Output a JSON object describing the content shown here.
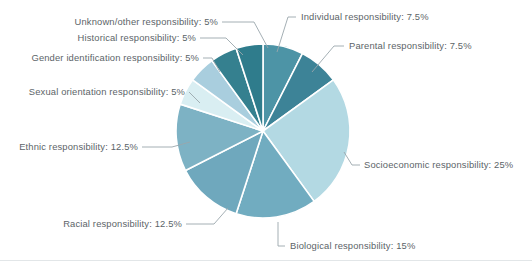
{
  "chart_data": {
    "type": "pie",
    "title": "",
    "legend_position": "callout-labels",
    "grid": false,
    "units": "percent",
    "total": 100,
    "start_angle_deg": 0,
    "direction": "clockwise",
    "categories": [
      "Individual responsibility",
      "Parental responsibility",
      "Socioeconomic responsibility",
      "Biological responsibility",
      "Racial responsibility",
      "Ethnic responsibility",
      "Sexual orientation responsibility",
      "Gender identification responsibility",
      "Historical responsibility",
      "Unknown/other responsibility"
    ],
    "values": [
      7.5,
      7.5,
      25,
      15,
      12.5,
      12.5,
      5,
      5,
      5,
      5
    ],
    "labels": [
      "Individual responsibility: 7.5%",
      "Parental responsibility: 7.5%",
      "Socioeconomic responsibility: 25%",
      "Biological responsibility: 15%",
      "Racial responsibility: 12.5%",
      "Ethnic responsibility: 12.5%",
      "Sexual orientation responsibility: 5%",
      "Gender identification responsibility: 5%",
      "Historical responsibility: 5%",
      "Unknown/other responsibility: 5%"
    ],
    "colors": [
      "#4d94a6",
      "#3d8397",
      "#b3d9e3",
      "#71acc0",
      "#6fa8bd",
      "#7db2c4",
      "#d9eef2",
      "#a9cede",
      "#35808f",
      "#2f7c8c"
    ],
    "slices": [
      {
        "label": "Individual responsibility: 7.5%",
        "name": "Individual responsibility",
        "value": 7.5,
        "color": "#4d94a6"
      },
      {
        "label": "Parental responsibility: 7.5%",
        "name": "Parental responsibility",
        "value": 7.5,
        "color": "#3d8397"
      },
      {
        "label": "Socioeconomic responsibility: 25%",
        "name": "Socioeconomic responsibility",
        "value": 25,
        "color": "#b3d9e3"
      },
      {
        "label": "Biological responsibility: 15%",
        "name": "Biological responsibility",
        "value": 15,
        "color": "#71acc0"
      },
      {
        "label": "Racial responsibility: 12.5%",
        "name": "Racial responsibility",
        "value": 12.5,
        "color": "#6fa8bd"
      },
      {
        "label": "Ethnic responsibility: 12.5%",
        "name": "Ethnic responsibility",
        "value": 12.5,
        "color": "#7db2c4"
      },
      {
        "label": "Sexual orientation responsibility: 5%",
        "name": "Sexual orientation responsibility",
        "value": 5,
        "color": "#d9eef2"
      },
      {
        "label": "Gender identification responsibility: 5%",
        "name": "Gender identification responsibility",
        "value": 5,
        "color": "#a9cede"
      },
      {
        "label": "Historical responsibility: 5%",
        "name": "Historical responsibility",
        "value": 5,
        "color": "#35808f"
      },
      {
        "label": "Unknown/other responsibility: 5%",
        "name": "Unknown/other responsibility",
        "value": 5,
        "color": "#2f7c8c"
      }
    ]
  },
  "labels_text": {
    "individual": "Individual responsibility: 7.5%",
    "parental": "Parental responsibility: 7.5%",
    "socioeconomic": "Socioeconomic responsibility: 25%",
    "biological": "Biological responsibility: 15%",
    "racial": "Racial responsibility: 12.5%",
    "ethnic": "Ethnic responsibility: 12.5%",
    "sexual_orientation": "Sexual orientation responsibility: 5%",
    "gender_identification": "Gender identification responsibility: 5%",
    "historical": "Historical responsibility: 5%",
    "unknown_other": "Unknown/other responsibility: 5%"
  },
  "geometry": {
    "center_x": 263,
    "center_y": 131,
    "radius": 87
  },
  "colors": {
    "background": "#ffffff",
    "label_text": "#5c6468",
    "leader_line": "#9aa6ab",
    "slice_separator": "#ffffff"
  }
}
